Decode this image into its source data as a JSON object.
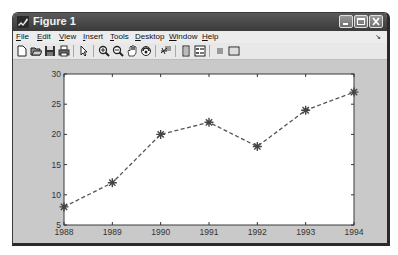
{
  "window": {
    "title": "Figure 1",
    "controls": [
      "minimize",
      "maximize",
      "close"
    ]
  },
  "menubar": {
    "items": [
      {
        "label": "File",
        "mnemonic": "F",
        "rest": "ile"
      },
      {
        "label": "Edit",
        "mnemonic": "E",
        "rest": "dit"
      },
      {
        "label": "View",
        "mnemonic": "V",
        "rest": "iew"
      },
      {
        "label": "Insert",
        "mnemonic": "I",
        "rest": "nsert"
      },
      {
        "label": "Tools",
        "mnemonic": "T",
        "rest": "ools"
      },
      {
        "label": "Desktop",
        "mnemonic": "D",
        "rest": "esktop"
      },
      {
        "label": "Window",
        "mnemonic": "W",
        "rest": "indow"
      },
      {
        "label": "Help",
        "mnemonic": "H",
        "rest": "elp"
      }
    ],
    "dock_arrow": "↘"
  },
  "toolbar": {
    "buttons": [
      "new-figure-icon",
      "open-file-icon",
      "save-icon",
      "print-icon",
      "edit-plot-icon",
      "zoom-in-icon",
      "zoom-out-icon",
      "pan-icon",
      "rotate-3d-icon",
      "data-cursor-icon",
      "colorbar-icon",
      "legend-icon",
      "hide-plot-tools-icon",
      "show-plot-tools-icon"
    ]
  },
  "chart_data": {
    "type": "line",
    "title": "",
    "xlabel": "",
    "ylabel": "",
    "x": [
      1988,
      1989,
      1990,
      1991,
      1992,
      1993,
      1994
    ],
    "series": [
      {
        "name": "data",
        "values": [
          8,
          12,
          20,
          22,
          18,
          24,
          27
        ],
        "line_style": "dashed",
        "marker": "*",
        "color": "#555555"
      }
    ],
    "xlim": [
      1988,
      1994
    ],
    "ylim": [
      5,
      30
    ],
    "xticks": [
      "1988",
      "1989",
      "1990",
      "1991",
      "1992",
      "1993",
      "1994"
    ],
    "yticks": [
      "5",
      "10",
      "15",
      "20",
      "25",
      "30"
    ],
    "grid": false,
    "legend": null
  }
}
